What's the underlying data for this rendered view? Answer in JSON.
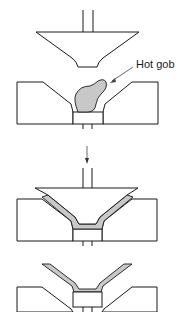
{
  "diagram": {
    "stages": [
      {
        "name": "gob-loaded",
        "description": "Plunger raised above mold; hot gob placed in mold cavity"
      },
      {
        "name": "pressing",
        "description": "Plunger lowered into mold, glass pressed into funnel shape"
      },
      {
        "name": "ejection",
        "description": "Plunger withdrawn, pressed glass part ejected from mold"
      }
    ],
    "labels": {
      "hot_gob": "Hot gob"
    },
    "colors": {
      "glass": "#c8c8c8",
      "outline": "#1a1a1a",
      "background": "#ffffff"
    }
  }
}
